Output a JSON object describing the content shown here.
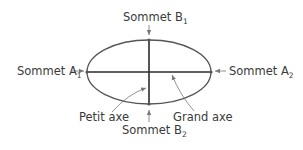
{
  "diagram": {
    "colors": {
      "stroke": "#555555",
      "axis": "#2b2b2b",
      "text": "#3a3a3a",
      "arrow": "#777777",
      "background": "#ffffff"
    },
    "ellipse": {
      "cx": 149,
      "cy": 72,
      "rx": 62,
      "ry": 32
    },
    "labels": {
      "sommet_b1": {
        "text": "Sommet B",
        "sub": "1"
      },
      "sommet_b2": {
        "text": "Sommet B",
        "sub": "2"
      },
      "sommet_a1": {
        "text": "Sommet A",
        "sub": "1"
      },
      "sommet_a2": {
        "text": "Sommet A",
        "sub": "2"
      },
      "petit_axe": "Petit axe",
      "grand_axe": "Grand axe"
    }
  }
}
